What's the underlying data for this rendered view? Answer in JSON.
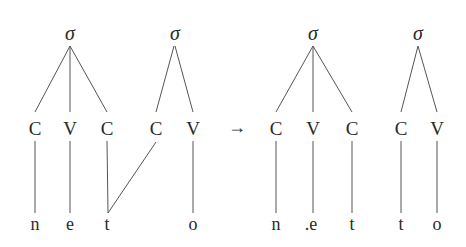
{
  "diagram": {
    "line_color": "#555555",
    "text_color": "#2a2a2a",
    "arrow": "→",
    "before": {
      "syllables": [
        {
          "label": "σ",
          "x": 70,
          "y": 33
        },
        {
          "label": "σ",
          "x": 175,
          "y": 33
        }
      ],
      "skeleton": [
        {
          "label": "C",
          "x": 35
        },
        {
          "label": "V",
          "x": 70
        },
        {
          "label": "C",
          "x": 107
        },
        {
          "label": "C",
          "x": 156
        },
        {
          "label": "V",
          "x": 193
        }
      ],
      "segments": [
        {
          "label": "n",
          "x": 35
        },
        {
          "label": "e",
          "x": 70
        },
        {
          "label": "t",
          "x": 107
        },
        {
          "label": "o",
          "x": 193
        }
      ]
    },
    "after": {
      "syllables": [
        {
          "label": "σ",
          "x": 313,
          "y": 33
        },
        {
          "label": "σ",
          "x": 418,
          "y": 33
        }
      ],
      "skeleton": [
        {
          "label": "C",
          "x": 276
        },
        {
          "label": "V",
          "x": 313
        },
        {
          "label": "C",
          "x": 352
        },
        {
          "label": "C",
          "x": 401
        },
        {
          "label": "V",
          "x": 437
        }
      ],
      "segments": [
        {
          "label": "n",
          "x": 276
        },
        {
          "label": ".e",
          "x": 311
        },
        {
          "label": "t",
          "x": 352
        },
        {
          "label": "t",
          "x": 401
        },
        {
          "label": "o",
          "x": 437
        }
      ]
    }
  }
}
